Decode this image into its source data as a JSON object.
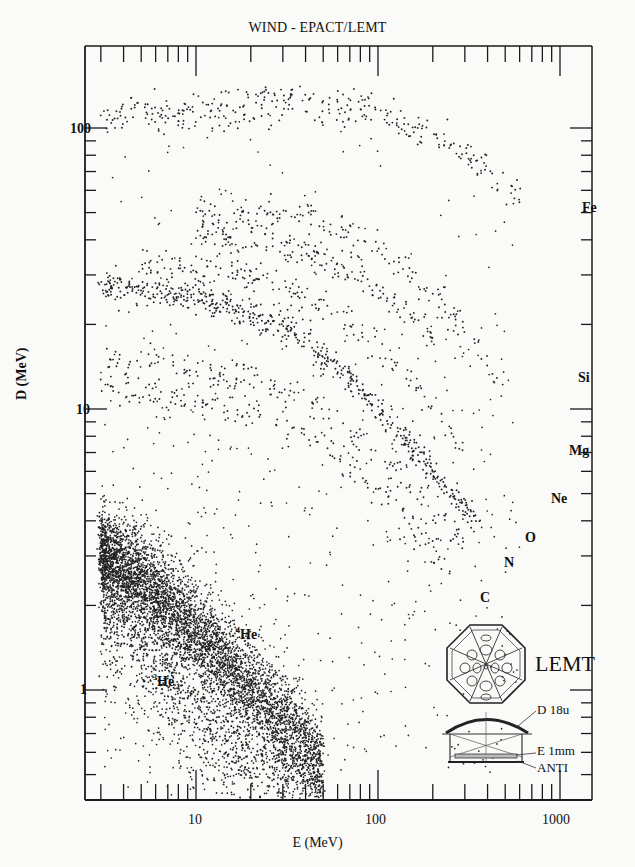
{
  "chart_data": {
    "type": "scatter",
    "title": "WIND - EPACT/LEMT",
    "xlabel": "E (MeV)",
    "ylabel": "D (MeV)",
    "xscale": "log",
    "yscale": "log",
    "xlim": [
      2.9,
      1800
    ],
    "ylim": [
      0.45,
      190
    ],
    "x_ticks": [
      {
        "value": 10,
        "label": "10"
      },
      {
        "value": 100,
        "label": "100"
      },
      {
        "value": 1000,
        "label": "1000"
      }
    ],
    "y_ticks": [
      {
        "value": 1,
        "label": "1"
      },
      {
        "value": 10,
        "label": "10"
      },
      {
        "value": 100,
        "label": "100"
      }
    ],
    "grid": false,
    "series": [
      {
        "name": "3He",
        "label": "³He",
        "label_pos": [
          7,
          0.9
        ],
        "track": [
          [
            3,
            2.2
          ],
          [
            5,
            1.6
          ],
          [
            10,
            1.0
          ],
          [
            20,
            0.65
          ]
        ],
        "density": "medium"
      },
      {
        "name": "4He",
        "label": "⁴He",
        "label_pos": [
          20,
          1.4
        ],
        "track": [
          [
            3,
            3.0
          ],
          [
            5,
            2.4
          ],
          [
            10,
            1.6
          ],
          [
            20,
            1.0
          ],
          [
            30,
            0.75
          ],
          [
            50,
            0.55
          ]
        ],
        "density": "very high"
      },
      {
        "name": "C",
        "label": "C",
        "label_pos": [
          380,
          1.8
        ],
        "track": [
          [
            3,
            12
          ],
          [
            10,
            11
          ],
          [
            30,
            9
          ],
          [
            80,
            6
          ],
          [
            150,
            4
          ],
          [
            250,
            2.6
          ]
        ],
        "density": "low"
      },
      {
        "name": "N",
        "label": "N",
        "label_pos": [
          480,
          2.4
        ],
        "track": [
          [
            3,
            15
          ],
          [
            10,
            14
          ],
          [
            40,
            11
          ],
          [
            100,
            7
          ],
          [
            200,
            4.5
          ],
          [
            300,
            3.2
          ]
        ],
        "density": "low"
      },
      {
        "name": "O",
        "label": "O",
        "label_pos": [
          600,
          3.0
        ],
        "track": [
          [
            3,
            27
          ],
          [
            10,
            25
          ],
          [
            30,
            20
          ],
          [
            60,
            14
          ],
          [
            100,
            10
          ],
          [
            200,
            6
          ],
          [
            350,
            4
          ]
        ],
        "density": "high"
      },
      {
        "name": "Ne",
        "label": "Ne",
        "label_pos": [
          700,
          4.1
        ],
        "track": [
          [
            5,
            33
          ],
          [
            20,
            30
          ],
          [
            60,
            22
          ],
          [
            150,
            13
          ],
          [
            300,
            7
          ]
        ],
        "density": "low"
      },
      {
        "name": "Mg",
        "label": "Mg",
        "label_pos": [
          900,
          5.7
        ],
        "track": [
          [
            10,
            40
          ],
          [
            30,
            38
          ],
          [
            80,
            30
          ],
          [
            200,
            18
          ]
        ],
        "density": "low"
      },
      {
        "name": "Si",
        "label": "Si",
        "label_pos": [
          900,
          11
        ],
        "track": [
          [
            10,
            50
          ],
          [
            40,
            48
          ],
          [
            100,
            38
          ],
          [
            250,
            22
          ],
          [
            500,
            12
          ]
        ],
        "density": "low"
      },
      {
        "name": "Fe",
        "label": "Fe",
        "label_pos": [
          950,
          72
        ],
        "track": [
          [
            3,
            110
          ],
          [
            10,
            115
          ],
          [
            40,
            125
          ],
          [
            100,
            115
          ],
          [
            200,
            95
          ],
          [
            400,
            70
          ],
          [
            600,
            55
          ]
        ],
        "density": "medium"
      }
    ],
    "annotations": [
      {
        "text": "LEMT",
        "type": "instrument-inset"
      },
      {
        "text": "D 18u"
      },
      {
        "text": "E 1mm"
      },
      {
        "text": "ANTI"
      }
    ]
  },
  "labels": {
    "title": "WIND - EPACT/LEMT",
    "xlabel": "E (MeV)",
    "ylabel": "D (MeV)",
    "xt10": "10",
    "xt100": "100",
    "xt1000": "1000",
    "yt1": "1",
    "yt10": "10",
    "yt100": "100",
    "fe": "Fe",
    "si": "Si",
    "mg": "Mg",
    "ne": "Ne",
    "o": "O",
    "n": "N",
    "c": "C",
    "he4": "He",
    "he3": "He",
    "he4sup": "4",
    "he3sup": "3",
    "lemt": "LEMT",
    "d18u": "D 18u",
    "e1mm": "E 1mm",
    "anti": "ANTI"
  }
}
